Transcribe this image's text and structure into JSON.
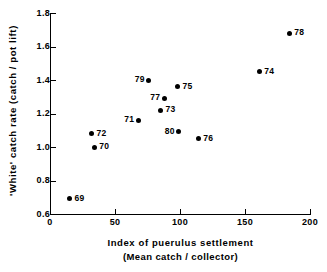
{
  "chart_data": {
    "type": "scatter",
    "title": "",
    "xlabel": "Index of puerulus settlement",
    "xlabel_sub": "(Mean catch / collector)",
    "ylabel": "'White' catch rate (catch / pot lift)",
    "xlim": [
      0,
      200
    ],
    "ylim": [
      0.6,
      1.8
    ],
    "xticks": [
      0,
      50,
      100,
      150,
      200
    ],
    "xtick_labels": [
      "0",
      "50",
      "100",
      "150",
      "200"
    ],
    "yticks": [
      0.6,
      0.8,
      1.0,
      1.2,
      1.4,
      1.6,
      1.8
    ],
    "ytick_labels": [
      "0.6",
      "0.8",
      "1.0",
      "1.2",
      "1.4",
      "1.6",
      "1.8"
    ],
    "grid": false,
    "legend": false,
    "marker": "filled-circle",
    "marker_color": "#000000",
    "points": [
      {
        "label": "69",
        "x": 15,
        "y": 0.69,
        "label_side": "right"
      },
      {
        "label": "70",
        "x": 34,
        "y": 1.0,
        "label_side": "right"
      },
      {
        "label": "72",
        "x": 32,
        "y": 1.08,
        "label_side": "right"
      },
      {
        "label": "71",
        "x": 68,
        "y": 1.16,
        "label_side": "left"
      },
      {
        "label": "73",
        "x": 85,
        "y": 1.22,
        "label_side": "right"
      },
      {
        "label": "77",
        "x": 88,
        "y": 1.29,
        "label_side": "left"
      },
      {
        "label": "79",
        "x": 76,
        "y": 1.4,
        "label_side": "left"
      },
      {
        "label": "75",
        "x": 98,
        "y": 1.36,
        "label_side": "right"
      },
      {
        "label": "80",
        "x": 99,
        "y": 1.09,
        "label_side": "left"
      },
      {
        "label": "76",
        "x": 114,
        "y": 1.05,
        "label_side": "right"
      },
      {
        "label": "74",
        "x": 161,
        "y": 1.45,
        "label_side": "right"
      },
      {
        "label": "78",
        "x": 184,
        "y": 1.68,
        "label_side": "right"
      }
    ]
  },
  "colors": {
    "axis": "#000000",
    "marker": "#000000",
    "background": "#ffffff"
  }
}
